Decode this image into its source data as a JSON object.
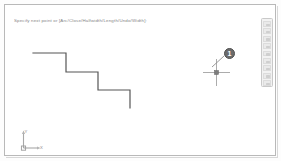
{
  "window": {
    "title": "CAD Drawing Area",
    "background_color": "#ffffff",
    "frame_color": "#b9b9b9"
  },
  "prompt": {
    "label": "Command prompt line",
    "text": "Specify next point or [Arc/Close/Halfwidth/Length/Undo/Width]:"
  },
  "tool_palette": {
    "name": "vertical-tool-palette",
    "position": "right",
    "buttons": [
      {
        "name": "palette-button-1",
        "label": ""
      },
      {
        "name": "palette-button-2",
        "label": ""
      },
      {
        "name": "palette-button-3",
        "label": ""
      },
      {
        "name": "palette-button-4",
        "label": ""
      },
      {
        "name": "palette-button-5",
        "label": ""
      },
      {
        "name": "palette-button-6",
        "label": ""
      },
      {
        "name": "palette-button-7",
        "label": ""
      },
      {
        "name": "palette-button-8",
        "label": ""
      },
      {
        "name": "palette-button-9",
        "label": ""
      }
    ]
  },
  "geometry": {
    "name": "stepped-polyline",
    "description": "Three-step descending staircase polyline",
    "stroke_color": "#555555",
    "stroke_width": 1.2,
    "points": [
      {
        "x": 33,
        "y": 53
      },
      {
        "x": 66,
        "y": 53
      },
      {
        "x": 66,
        "y": 72
      },
      {
        "x": 98,
        "y": 72
      },
      {
        "x": 98,
        "y": 90
      },
      {
        "x": 130,
        "y": 90
      },
      {
        "x": 130,
        "y": 108
      }
    ]
  },
  "cursor": {
    "name": "crosshair-cursor",
    "center_x": 211,
    "center_y": 67,
    "arm_length": 13,
    "pickbox_size": 4,
    "color": "#9a9a9a",
    "pickbox_color": "#808080"
  },
  "callout": {
    "name": "callout-marker-1",
    "number": "1",
    "badge_color": "#6b6b6b",
    "text_color": "#ffffff",
    "leader_from": {
      "x": 219,
      "y": 52
    },
    "leader_to": {
      "x": 212,
      "y": 66
    }
  },
  "ucs": {
    "name": "ucs-icon",
    "x_label": "X",
    "y_label": "Y",
    "color": "#9c9c9c"
  }
}
